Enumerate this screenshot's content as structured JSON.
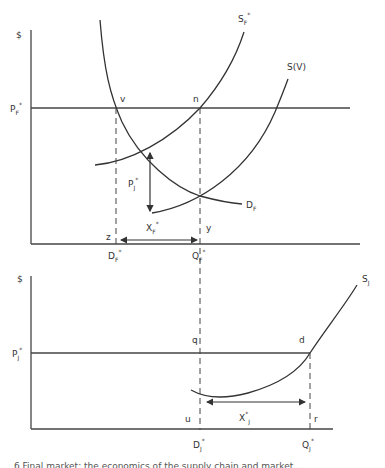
{
  "diagram": {
    "top_panel": {
      "y_axis_label": "$",
      "price_line_label": "P",
      "price_line_sub": "F",
      "price_line_sup": "*",
      "points": {
        "v": "v",
        "n": "n",
        "z": "z",
        "y": "y"
      },
      "curves": {
        "supply_star": {
          "main": "S",
          "sub": "F",
          "sup": "*"
        },
        "supply_v": "S(V)",
        "demand": {
          "main": "D",
          "sub": "F"
        }
      },
      "gap_label": {
        "main": "P",
        "sub": "J",
        "sup": "*"
      },
      "quantity_gap": {
        "main": "X",
        "sub": "F",
        "sup": "*"
      },
      "x_ticks": [
        {
          "main": "D",
          "sub": "F",
          "sup": "*"
        },
        {
          "main": "Q",
          "sub": "F",
          "sup": "*"
        }
      ]
    },
    "bottom_panel": {
      "y_axis_label": "$",
      "price_line_label": "P",
      "price_line_sub": "J",
      "price_line_sup": "*",
      "points": {
        "q": "q",
        "d": "d",
        "u": "u",
        "r": "r"
      },
      "curves": {
        "supply": {
          "main": "S",
          "sub": "J"
        }
      },
      "quantity_gap": {
        "main": "X",
        "sup": "*",
        "sub": "J"
      },
      "x_ticks": [
        {
          "main": "D",
          "sub": "J",
          "sup": "*"
        },
        {
          "main": "Q",
          "sub": "J",
          "sup": "*"
        }
      ]
    },
    "caption": "6   Final market: the economics of the supply chain and market..."
  },
  "colors": {
    "line": "#333333",
    "text": "#333333",
    "background": "#ffffff"
  }
}
